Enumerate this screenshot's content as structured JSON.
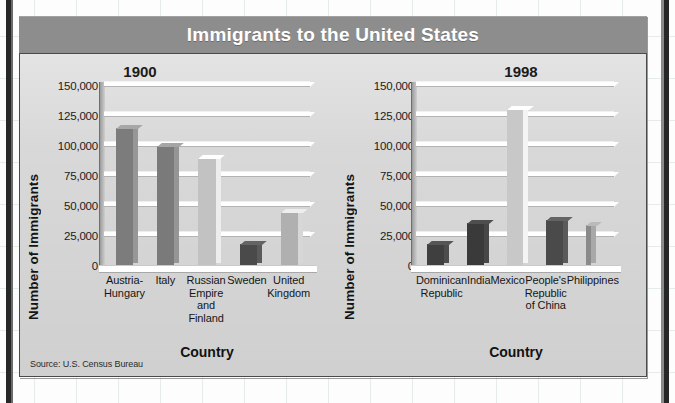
{
  "figure": {
    "title": "Immigrants to the United States",
    "source": "Source: U.S. Census Bureau",
    "panel_color": "#d8d8d8",
    "title_bar_color": "#8d8d8d"
  },
  "chart_data": [
    {
      "type": "bar",
      "title": "1900",
      "xlabel": "Country",
      "ylabel": "Number of Immigrants",
      "ylim": [
        0,
        150000
      ],
      "yticks": [
        "0",
        "25,000",
        "50,000",
        "75,000",
        "100,000",
        "125,000",
        "150,000"
      ],
      "ytick_values": [
        0,
        25000,
        50000,
        75000,
        100000,
        125000,
        150000
      ],
      "grid": true,
      "legend": "none",
      "categories": [
        "Austria-\nHungary",
        "Italy",
        "Russian\nEmpire\nand Finland",
        "Sweden",
        "United\nKingdom"
      ],
      "values": [
        115000,
        100000,
        90000,
        18000,
        45000
      ],
      "bar_colors": [
        "#7c7c7c",
        "#7a7a7a",
        "#c2c2c2",
        "#4a4a4a",
        "#b0b0b0"
      ]
    },
    {
      "type": "bar",
      "title": "1998",
      "xlabel": "Country",
      "ylabel": "Number of Immigrants",
      "ylim": [
        0,
        150000
      ],
      "yticks": [
        "0",
        "25,000",
        "50,000",
        "75,000",
        "100,000",
        "125,000",
        "150,000"
      ],
      "ytick_values": [
        0,
        25000,
        50000,
        75000,
        100000,
        125000,
        150000
      ],
      "grid": true,
      "legend": "none",
      "categories": [
        "Dominican\nRepublic",
        "India",
        "Mexico",
        "People's\nRepublic\nof China",
        "Philippines"
      ],
      "values": [
        18000,
        36000,
        131000,
        38000,
        34000
      ],
      "bar_colors": [
        "#3f3f3f",
        "#3a3a3a",
        "#c8c8c8",
        "#4a4a4a",
        "#8a8a8a"
      ]
    }
  ]
}
